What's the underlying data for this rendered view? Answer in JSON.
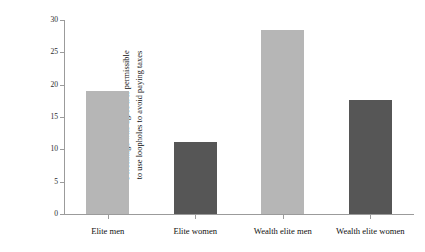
{
  "chart_data": {
    "type": "bar",
    "title": "",
    "subtitle": "",
    "xlabel": "",
    "ylabel_line1": "Percentage who agree it is permissible",
    "ylabel_line2": "to use loopholes to avoid paying taxes",
    "categories": [
      "Elite men",
      "Elite women",
      "Wealth elite men",
      "Wealth elite women"
    ],
    "values": [
      19.0,
      11.1,
      28.5,
      17.6
    ],
    "bar_colors": [
      "#b6b6b6",
      "#565656",
      "#b6b6b6",
      "#565656"
    ],
    "ylim": [
      0,
      30
    ],
    "yticks": [
      0,
      5,
      10,
      15,
      20,
      25,
      30
    ],
    "ytick_labels": [
      "0",
      "5",
      "10",
      "15",
      "20",
      "25",
      "30"
    ],
    "grid": false,
    "legend": "none",
    "axis_color": "#9b9b9b",
    "background": "#ffffff"
  }
}
